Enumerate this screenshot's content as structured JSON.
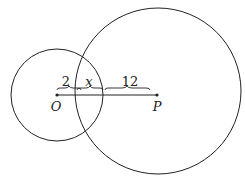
{
  "diagram": {
    "points": [
      {
        "id": "O",
        "label": "O"
      },
      {
        "id": "P",
        "label": "P"
      }
    ],
    "segments": [
      {
        "id": "seg-2",
        "label": "2"
      },
      {
        "id": "seg-x",
        "label": "x"
      },
      {
        "id": "seg-12",
        "label": "12"
      }
    ],
    "circles": [
      {
        "id": "small-circle",
        "center": "O"
      },
      {
        "id": "large-circle",
        "center": "P"
      }
    ],
    "colors": {
      "stroke": "#222222",
      "background": "#ffffff"
    }
  }
}
